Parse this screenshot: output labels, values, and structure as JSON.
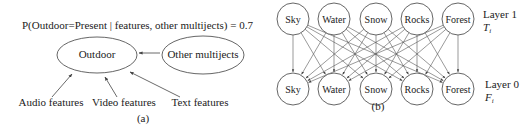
{
  "panel_a": {
    "title": "P(Outdoor=Present | features, other multijects) = 0.7",
    "center_node": "Outdoor",
    "side_node": "Other multijects",
    "inputs": [
      "Audio features",
      "Video features",
      "Text features"
    ],
    "caption": "(a)"
  },
  "panel_b": {
    "top_layer": {
      "label": "Layer 1",
      "symbol": "T",
      "subscript": "i",
      "nodes": [
        "Sky",
        "Water",
        "Snow",
        "Rocks",
        "Forest"
      ]
    },
    "bottom_layer": {
      "label": "Layer 0",
      "symbol": "F",
      "subscript": "i",
      "nodes": [
        "Sky",
        "Water",
        "Snow",
        "Rocks",
        "Forest"
      ]
    },
    "caption": "(b)"
  },
  "colors": {
    "stroke": "#555555",
    "text": "#222222",
    "background": "#ffffff"
  }
}
